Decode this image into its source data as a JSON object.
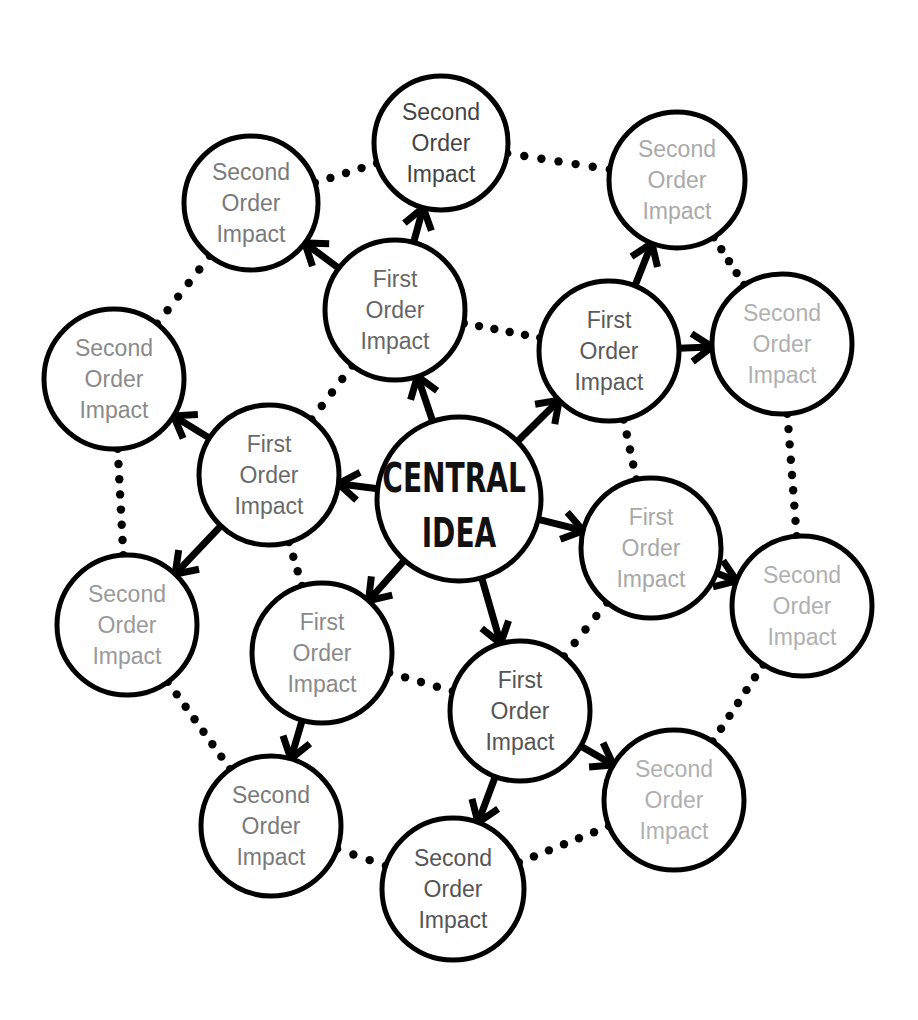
{
  "diagram": {
    "type": "mind-map",
    "central": {
      "id": "central",
      "lines": [
        "CENTRAL",
        "IDEA"
      ],
      "x": 459,
      "y": 499,
      "r": 82,
      "text_color": "#111111"
    },
    "nodes": [
      {
        "id": "f1",
        "order": "first",
        "lines": [
          "First",
          "Order",
          "Impact"
        ],
        "x": 395,
        "y": 310,
        "r": 70,
        "text_color": "#666666"
      },
      {
        "id": "f2",
        "order": "first",
        "lines": [
          "First",
          "Order",
          "Impact"
        ],
        "x": 609,
        "y": 351,
        "r": 70,
        "text_color": "#5a5a5a"
      },
      {
        "id": "f3",
        "order": "first",
        "lines": [
          "First",
          "Order",
          "Impact"
        ],
        "x": 651,
        "y": 548,
        "r": 70,
        "text_color": "#a8a8a8"
      },
      {
        "id": "f4",
        "order": "first",
        "lines": [
          "First",
          "Order",
          "Impact"
        ],
        "x": 520,
        "y": 711,
        "r": 70,
        "text_color": "#555555"
      },
      {
        "id": "f5",
        "order": "first",
        "lines": [
          "First",
          "Order",
          "Impact"
        ],
        "x": 322,
        "y": 653,
        "r": 70,
        "text_color": "#8a8a8a"
      },
      {
        "id": "f6",
        "order": "first",
        "lines": [
          "First",
          "Order",
          "Impact"
        ],
        "x": 269,
        "y": 475,
        "r": 70,
        "text_color": "#6a6a6a"
      },
      {
        "id": "s1",
        "order": "second",
        "lines": [
          "Second",
          "Order",
          "Impact"
        ],
        "x": 441,
        "y": 143,
        "r": 67,
        "text_color": "#444444"
      },
      {
        "id": "s2",
        "order": "second",
        "lines": [
          "Second",
          "Order",
          "Impact"
        ],
        "x": 251,
        "y": 203,
        "r": 67,
        "text_color": "#7a7a7a"
      },
      {
        "id": "s3",
        "order": "second",
        "lines": [
          "Second",
          "Order",
          "Impact"
        ],
        "x": 677,
        "y": 180,
        "r": 68,
        "text_color": "#aaaaaa"
      },
      {
        "id": "s4",
        "order": "second",
        "lines": [
          "Second",
          "Order",
          "Impact"
        ],
        "x": 782,
        "y": 344,
        "r": 70,
        "text_color": "#b0b0b0"
      },
      {
        "id": "s5",
        "order": "second",
        "lines": [
          "Second",
          "Order",
          "Impact"
        ],
        "x": 114,
        "y": 379,
        "r": 70,
        "text_color": "#8a8a8a"
      },
      {
        "id": "s6",
        "order": "second",
        "lines": [
          "Second",
          "Order",
          "Impact"
        ],
        "x": 127,
        "y": 625,
        "r": 70,
        "text_color": "#9a9a9a"
      },
      {
        "id": "s7",
        "order": "second",
        "lines": [
          "Second",
          "Order",
          "Impact"
        ],
        "x": 802,
        "y": 606,
        "r": 70,
        "text_color": "#b0b0b0"
      },
      {
        "id": "s8",
        "order": "second",
        "lines": [
          "Second",
          "Order",
          "Impact"
        ],
        "x": 674,
        "y": 800,
        "r": 70,
        "text_color": "#b0b0b0"
      },
      {
        "id": "s9",
        "order": "second",
        "lines": [
          "Second",
          "Order",
          "Impact"
        ],
        "x": 453,
        "y": 889,
        "r": 71,
        "text_color": "#555555"
      },
      {
        "id": "s10",
        "order": "second",
        "lines": [
          "Second",
          "Order",
          "Impact"
        ],
        "x": 271,
        "y": 826,
        "r": 70,
        "text_color": "#7a7a7a"
      }
    ],
    "arrows": [
      [
        "central",
        "f1"
      ],
      [
        "central",
        "f2"
      ],
      [
        "central",
        "f3"
      ],
      [
        "central",
        "f4"
      ],
      [
        "central",
        "f5"
      ],
      [
        "central",
        "f6"
      ],
      [
        "f1",
        "s1"
      ],
      [
        "f1",
        "s2"
      ],
      [
        "f2",
        "s3"
      ],
      [
        "f2",
        "s4"
      ],
      [
        "f6",
        "s5"
      ],
      [
        "f6",
        "s6"
      ],
      [
        "f3",
        "s7"
      ],
      [
        "f4",
        "s8"
      ],
      [
        "f4",
        "s9"
      ],
      [
        "f5",
        "s10"
      ]
    ],
    "dotted_links": [
      [
        "f1",
        "f2"
      ],
      [
        "f2",
        "f3"
      ],
      [
        "f3",
        "f4"
      ],
      [
        "f4",
        "f5"
      ],
      [
        "f5",
        "f6"
      ],
      [
        "f6",
        "f1"
      ],
      [
        "s2",
        "s1"
      ],
      [
        "s1",
        "s3"
      ],
      [
        "s3",
        "s4"
      ],
      [
        "s4",
        "s7"
      ],
      [
        "s7",
        "s8"
      ],
      [
        "s8",
        "s9"
      ],
      [
        "s9",
        "s10"
      ],
      [
        "s10",
        "s6"
      ],
      [
        "s6",
        "s5"
      ],
      [
        "s5",
        "s2"
      ]
    ],
    "style": {
      "stroke": "#000000",
      "background": "#ffffff",
      "circle_stroke_width": 5,
      "arrow_stroke_width": 7,
      "dot_radius": 4.2,
      "dot_spacing": 16
    }
  }
}
